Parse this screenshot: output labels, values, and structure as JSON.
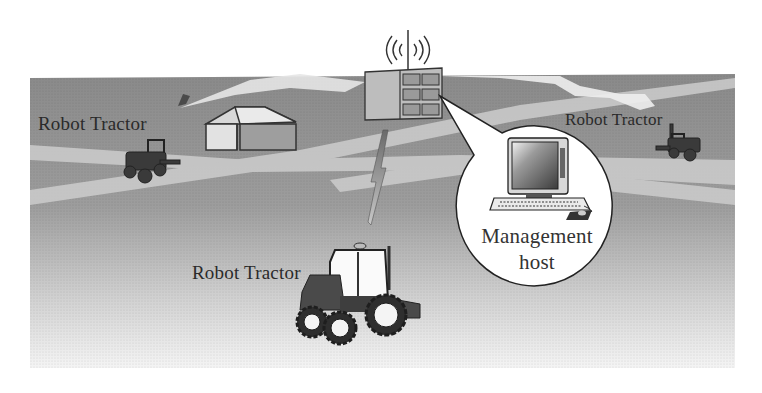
{
  "diagram": {
    "labels": {
      "tractor_left": "Robot Tractor",
      "tractor_right": "Robot Tractor",
      "tractor_main": "Robot Tractor",
      "host_line1": "Management",
      "host_line2": "host"
    },
    "nodes": [
      {
        "id": "base-station",
        "type": "antenna tower / relay"
      },
      {
        "id": "management-host",
        "type": "computer"
      },
      {
        "id": "barn",
        "type": "building"
      },
      {
        "id": "tractor-left",
        "type": "robot tractor"
      },
      {
        "id": "tractor-right",
        "type": "robot tractor"
      },
      {
        "id": "tractor-main",
        "type": "robot tractor"
      }
    ],
    "links": [
      {
        "from": "base-station",
        "to": "tractor-left",
        "style": "lightning-arrow"
      },
      {
        "from": "base-station",
        "to": "tractor-right",
        "style": "lightning-arrow"
      },
      {
        "from": "base-station",
        "to": "tractor-main",
        "style": "lightning-arrow"
      },
      {
        "from": "base-station",
        "to": "management-host",
        "style": "callout"
      }
    ],
    "colors": {
      "field_top": "#8c8c8c",
      "field_bottom": "#f2f2f2",
      "path_light": "#c9c9c9",
      "outline": "#222222",
      "callout_fill": "#ffffff"
    }
  }
}
